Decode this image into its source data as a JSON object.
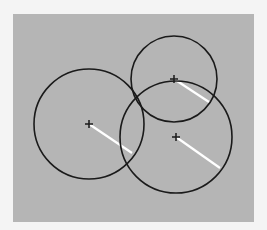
{
  "canvas": {
    "background": "#f4f4f4",
    "panel": {
      "x": 13,
      "y": 14,
      "width": 241,
      "height": 208,
      "fill": "#b5b5b5"
    }
  },
  "circles": [
    {
      "id": "left",
      "cx": 89,
      "cy": 124,
      "r": 55,
      "radius_line_end": [
        132,
        153
      ]
    },
    {
      "id": "top",
      "cx": 174,
      "cy": 79,
      "r": 43,
      "radius_line_end": [
        209,
        102
      ]
    },
    {
      "id": "bottom-right",
      "cx": 176,
      "cy": 137,
      "r": 56,
      "radius_line_end": [
        220,
        168
      ]
    }
  ],
  "style": {
    "circle_stroke": "#1a1a1a",
    "circle_stroke_width": 1.6,
    "radius_line_color": "#ffffff",
    "radius_line_width": 2.2,
    "center_mark_color": "#1a1a1a",
    "center_mark_size": 4
  }
}
